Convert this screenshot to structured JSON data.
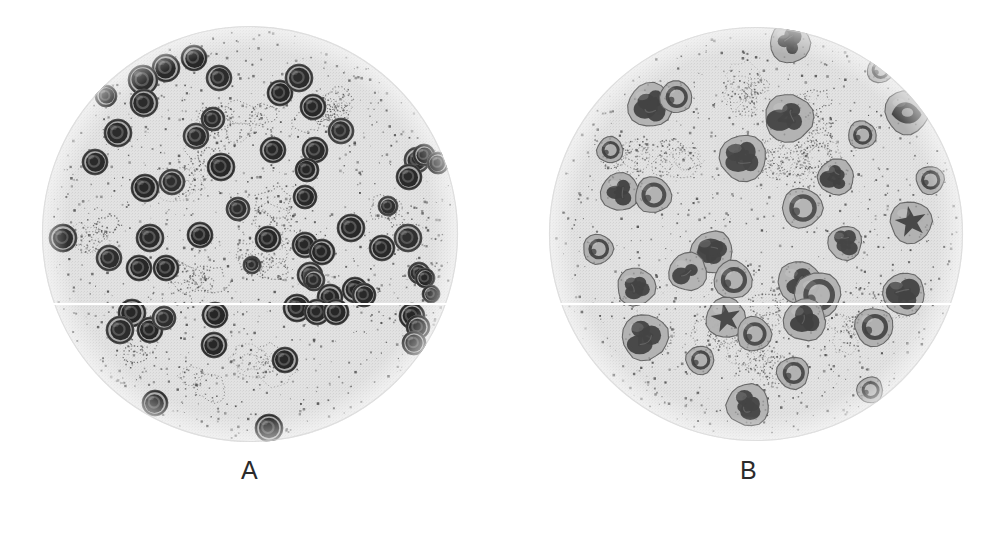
{
  "figure": {
    "kind": "micrograph-figure",
    "background_color": "#ffffff",
    "width": 998,
    "height": 534
  },
  "panels": [
    {
      "id": "A",
      "label": "A",
      "label_color": "#2b2b2b",
      "field": {
        "center_x": 250,
        "center_y": 234,
        "radius": 208,
        "background_color": "#e2e2e2",
        "rim_color": "#d2d2d2",
        "speckle_color": "#4a4a4a",
        "speckle_count": 1150,
        "platelet_clump_count": 16
      },
      "cell_type": "round-nucleus-cell",
      "cell_count": 63,
      "cell_palette": {
        "membrane": "#6f6f6f",
        "cytoplasm": "#9a9a9a",
        "nucleus_dark": "#1e1e1e",
        "nucleus_mid": "#3a3a3a",
        "nucleus_ring": "#5c5c5c",
        "highlight": "#b5b5b5"
      },
      "cells": [
        {
          "x": 166,
          "y": 68,
          "r": 14,
          "tone": 0.82,
          "ring": 0.58
        },
        {
          "x": 194,
          "y": 58,
          "r": 13,
          "tone": 0.9,
          "ring": 0.52
        },
        {
          "x": 143,
          "y": 80,
          "r": 15,
          "tone": 0.72,
          "ring": 0.6
        },
        {
          "x": 219,
          "y": 78,
          "r": 13,
          "tone": 0.68,
          "ring": 0.55
        },
        {
          "x": 106,
          "y": 96,
          "r": 11,
          "tone": 0.95,
          "ring": 0.4
        },
        {
          "x": 144,
          "y": 103,
          "r": 14,
          "tone": 0.76,
          "ring": 0.62
        },
        {
          "x": 280,
          "y": 93,
          "r": 13,
          "tone": 0.88,
          "ring": 0.5
        },
        {
          "x": 299,
          "y": 78,
          "r": 14,
          "tone": 0.7,
          "ring": 0.58
        },
        {
          "x": 313,
          "y": 107,
          "r": 13,
          "tone": 0.86,
          "ring": 0.52
        },
        {
          "x": 118,
          "y": 133,
          "r": 14,
          "tone": 0.74,
          "ring": 0.6
        },
        {
          "x": 196,
          "y": 136,
          "r": 13,
          "tone": 0.66,
          "ring": 0.57
        },
        {
          "x": 341,
          "y": 131,
          "r": 13,
          "tone": 0.58,
          "ring": 0.5
        },
        {
          "x": 273,
          "y": 150,
          "r": 13,
          "tone": 0.84,
          "ring": 0.55
        },
        {
          "x": 315,
          "y": 150,
          "r": 13,
          "tone": 0.8,
          "ring": 0.54
        },
        {
          "x": 95,
          "y": 162,
          "r": 13,
          "tone": 0.78,
          "ring": 0.56
        },
        {
          "x": 221,
          "y": 167,
          "r": 14,
          "tone": 0.9,
          "ring": 0.52
        },
        {
          "x": 145,
          "y": 188,
          "r": 14,
          "tone": 0.86,
          "ring": 0.58
        },
        {
          "x": 172,
          "y": 182,
          "r": 13,
          "tone": 0.6,
          "ring": 0.5
        },
        {
          "x": 307,
          "y": 170,
          "r": 12,
          "tone": 0.88,
          "ring": 0.5
        },
        {
          "x": 305,
          "y": 197,
          "r": 12,
          "tone": 0.84,
          "ring": 0.52
        },
        {
          "x": 238,
          "y": 209,
          "r": 12,
          "tone": 0.62,
          "ring": 0.5
        },
        {
          "x": 417,
          "y": 160,
          "r": 13,
          "tone": 0.56,
          "ring": 0.46
        },
        {
          "x": 424,
          "y": 155,
          "r": 11,
          "tone": 0.86,
          "ring": 0.46
        },
        {
          "x": 438,
          "y": 163,
          "r": 11,
          "tone": 0.92,
          "ring": 0.44
        },
        {
          "x": 409,
          "y": 177,
          "r": 13,
          "tone": 0.8,
          "ring": 0.52
        },
        {
          "x": 63,
          "y": 238,
          "r": 14,
          "tone": 0.62,
          "ring": 0.5
        },
        {
          "x": 150,
          "y": 238,
          "r": 14,
          "tone": 0.78,
          "ring": 0.58
        },
        {
          "x": 200,
          "y": 235,
          "r": 13,
          "tone": 0.88,
          "ring": 0.55
        },
        {
          "x": 268,
          "y": 239,
          "r": 13,
          "tone": 0.9,
          "ring": 0.55
        },
        {
          "x": 351,
          "y": 228,
          "r": 14,
          "tone": 0.86,
          "ring": 0.56
        },
        {
          "x": 305,
          "y": 245,
          "r": 13,
          "tone": 0.84,
          "ring": 0.54
        },
        {
          "x": 322,
          "y": 252,
          "r": 13,
          "tone": 0.92,
          "ring": 0.5
        },
        {
          "x": 382,
          "y": 248,
          "r": 13,
          "tone": 0.86,
          "ring": 0.52
        },
        {
          "x": 408,
          "y": 238,
          "r": 14,
          "tone": 0.58,
          "ring": 0.48
        },
        {
          "x": 109,
          "y": 258,
          "r": 13,
          "tone": 0.66,
          "ring": 0.54
        },
        {
          "x": 139,
          "y": 268,
          "r": 13,
          "tone": 0.9,
          "ring": 0.52
        },
        {
          "x": 166,
          "y": 268,
          "r": 13,
          "tone": 0.88,
          "ring": 0.52
        },
        {
          "x": 310,
          "y": 275,
          "r": 13,
          "tone": 0.78,
          "ring": 0.54
        },
        {
          "x": 314,
          "y": 280,
          "r": 11,
          "tone": 0.64,
          "ring": 0.46
        },
        {
          "x": 355,
          "y": 290,
          "r": 13,
          "tone": 0.9,
          "ring": 0.52
        },
        {
          "x": 419,
          "y": 273,
          "r": 11,
          "tone": 0.66,
          "ring": 0.46
        },
        {
          "x": 425,
          "y": 278,
          "r": 10,
          "tone": 0.88,
          "ring": 0.44
        },
        {
          "x": 330,
          "y": 297,
          "r": 13,
          "tone": 0.88,
          "ring": 0.54
        },
        {
          "x": 364,
          "y": 295,
          "r": 12,
          "tone": 0.82,
          "ring": 0.5
        },
        {
          "x": 297,
          "y": 308,
          "r": 14,
          "tone": 0.9,
          "ring": 0.56
        },
        {
          "x": 317,
          "y": 312,
          "r": 13,
          "tone": 0.86,
          "ring": 0.52
        },
        {
          "x": 336,
          "y": 312,
          "r": 13,
          "tone": 0.9,
          "ring": 0.52
        },
        {
          "x": 431,
          "y": 294,
          "r": 9,
          "tone": 0.9,
          "ring": 0.42
        },
        {
          "x": 412,
          "y": 316,
          "r": 13,
          "tone": 0.92,
          "ring": 0.52
        },
        {
          "x": 418,
          "y": 327,
          "r": 12,
          "tone": 0.88,
          "ring": 0.5
        },
        {
          "x": 414,
          "y": 343,
          "r": 12,
          "tone": 0.66,
          "ring": 0.48
        },
        {
          "x": 132,
          "y": 313,
          "r": 14,
          "tone": 0.9,
          "ring": 0.56
        },
        {
          "x": 120,
          "y": 330,
          "r": 14,
          "tone": 0.7,
          "ring": 0.56
        },
        {
          "x": 150,
          "y": 330,
          "r": 13,
          "tone": 0.88,
          "ring": 0.52
        },
        {
          "x": 164,
          "y": 318,
          "r": 12,
          "tone": 0.62,
          "ring": 0.48
        },
        {
          "x": 215,
          "y": 315,
          "r": 13,
          "tone": 0.92,
          "ring": 0.54
        },
        {
          "x": 214,
          "y": 345,
          "r": 13,
          "tone": 0.9,
          "ring": 0.54
        },
        {
          "x": 285,
          "y": 360,
          "r": 13,
          "tone": 0.84,
          "ring": 0.54
        },
        {
          "x": 155,
          "y": 403,
          "r": 13,
          "tone": 0.9,
          "ring": 0.54
        },
        {
          "x": 269,
          "y": 428,
          "r": 14,
          "tone": 0.9,
          "ring": 0.56
        },
        {
          "x": 213,
          "y": 119,
          "r": 12,
          "tone": 0.7,
          "ring": 0.52
        },
        {
          "x": 252,
          "y": 265,
          "r": 9,
          "tone": 0.6,
          "ring": 0.44
        },
        {
          "x": 388,
          "y": 206,
          "r": 10,
          "tone": 0.58,
          "ring": 0.44
        }
      ]
    },
    {
      "id": "B",
      "label": "B",
      "label_color": "#2b2b2b",
      "field": {
        "center_x": 756,
        "center_y": 234,
        "radius": 207,
        "background_color": "#e2e2e2",
        "rim_color": "#d2d2d2",
        "speckle_color": "#4a4a4a",
        "speckle_count": 1000,
        "platelet_clump_count": 18
      },
      "cell_type": "lobed-nucleus-cell",
      "cell_count": 33,
      "cell_palette": {
        "membrane": "#767676",
        "cytoplasm": "#a3a3a3",
        "nucleus_dark": "#3c3c3c",
        "nucleus_mid": "#555555",
        "nucleus_ring": "#6e6e6e",
        "highlight": "#bcbcbc"
      },
      "cells": [
        {
          "x": 650,
          "y": 105,
          "r": 22,
          "tone": 0.72,
          "nucleus": "lobed"
        },
        {
          "x": 790,
          "y": 43,
          "r": 20,
          "tone": 0.78,
          "nucleus": "lobed"
        },
        {
          "x": 789,
          "y": 118,
          "r": 24,
          "tone": 0.7,
          "nucleus": "lobed"
        },
        {
          "x": 907,
          "y": 112,
          "r": 22,
          "tone": 0.86,
          "nucleus": "band"
        },
        {
          "x": 743,
          "y": 158,
          "r": 23,
          "tone": 0.6,
          "nucleus": "lobed"
        },
        {
          "x": 836,
          "y": 177,
          "r": 18,
          "tone": 0.8,
          "nucleus": "lobed"
        },
        {
          "x": 620,
          "y": 192,
          "r": 19,
          "tone": 0.82,
          "nucleus": "lobed"
        },
        {
          "x": 653,
          "y": 195,
          "r": 18,
          "tone": 0.7,
          "nucleus": "ring"
        },
        {
          "x": 802,
          "y": 208,
          "r": 20,
          "tone": 0.58,
          "nucleus": "ring"
        },
        {
          "x": 911,
          "y": 222,
          "r": 21,
          "tone": 0.78,
          "nucleus": "star"
        },
        {
          "x": 845,
          "y": 243,
          "r": 17,
          "tone": 0.6,
          "nucleus": "lobed"
        },
        {
          "x": 712,
          "y": 252,
          "r": 21,
          "tone": 0.74,
          "nucleus": "lobed"
        },
        {
          "x": 688,
          "y": 272,
          "r": 19,
          "tone": 0.64,
          "nucleus": "lobed"
        },
        {
          "x": 733,
          "y": 280,
          "r": 19,
          "tone": 0.76,
          "nucleus": "ring"
        },
        {
          "x": 636,
          "y": 287,
          "r": 19,
          "tone": 0.74,
          "nucleus": "lobed"
        },
        {
          "x": 799,
          "y": 282,
          "r": 21,
          "tone": 0.7,
          "nucleus": "lobed"
        },
        {
          "x": 818,
          "y": 295,
          "r": 23,
          "tone": 0.62,
          "nucleus": "ring"
        },
        {
          "x": 904,
          "y": 294,
          "r": 21,
          "tone": 0.72,
          "nucleus": "lobed"
        },
        {
          "x": 805,
          "y": 320,
          "r": 21,
          "tone": 0.84,
          "nucleus": "lobed"
        },
        {
          "x": 726,
          "y": 318,
          "r": 20,
          "tone": 0.66,
          "nucleus": "star"
        },
        {
          "x": 754,
          "y": 334,
          "r": 17,
          "tone": 0.78,
          "nucleus": "ring"
        },
        {
          "x": 645,
          "y": 337,
          "r": 23,
          "tone": 0.72,
          "nucleus": "lobed"
        },
        {
          "x": 874,
          "y": 327,
          "r": 19,
          "tone": 0.86,
          "nucleus": "ring"
        },
        {
          "x": 793,
          "y": 373,
          "r": 16,
          "tone": 0.8,
          "nucleus": "ring"
        },
        {
          "x": 748,
          "y": 405,
          "r": 21,
          "tone": 0.66,
          "nucleus": "lobed"
        },
        {
          "x": 676,
          "y": 97,
          "r": 16,
          "tone": 0.85,
          "nucleus": "ring"
        },
        {
          "x": 862,
          "y": 135,
          "r": 14,
          "tone": 0.88,
          "nucleus": "ring"
        },
        {
          "x": 598,
          "y": 249,
          "r": 15,
          "tone": 0.9,
          "nucleus": "ring"
        },
        {
          "x": 930,
          "y": 180,
          "r": 14,
          "tone": 0.9,
          "nucleus": "ring"
        },
        {
          "x": 700,
          "y": 360,
          "r": 14,
          "tone": 0.9,
          "nucleus": "ring"
        },
        {
          "x": 870,
          "y": 390,
          "r": 13,
          "tone": 0.9,
          "nucleus": "ring"
        },
        {
          "x": 610,
          "y": 150,
          "r": 13,
          "tone": 0.92,
          "nucleus": "ring"
        },
        {
          "x": 880,
          "y": 70,
          "r": 13,
          "tone": 0.92,
          "nucleus": "ring"
        }
      ]
    }
  ],
  "artifacts": {
    "scan_seam": {
      "name": "horizontal-scan-seam",
      "y": 303,
      "color": "#ffffff",
      "thickness": 2
    }
  }
}
